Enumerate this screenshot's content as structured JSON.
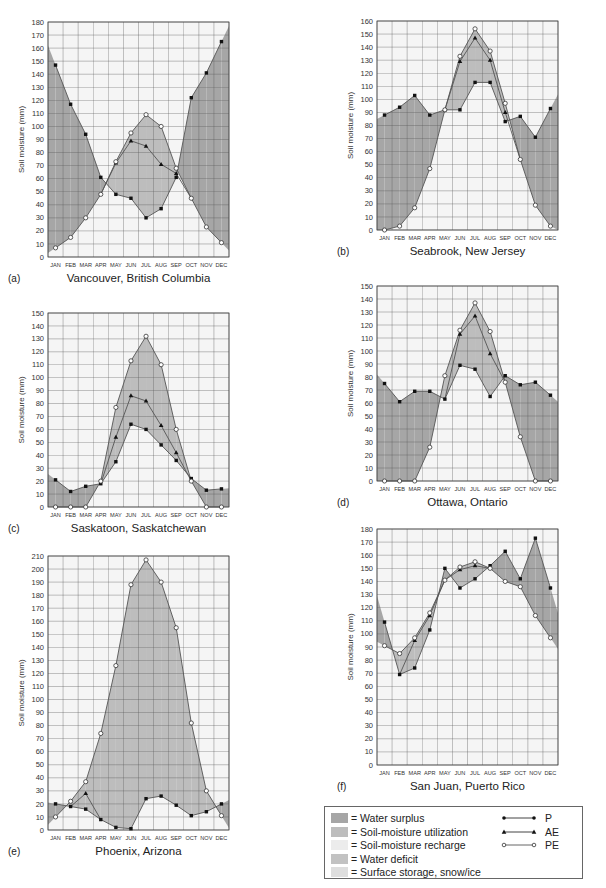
{
  "colors": {
    "surplus": "#a6a6a6",
    "utilization": "#bdbdbd",
    "recharge": "#ececec",
    "deficit": "#c2c2c2",
    "storage": "#dedede",
    "plot_bg": "#f5f5f5",
    "grid": "#5a5a5a",
    "line": "#555555"
  },
  "legend": {
    "areas": [
      {
        "key": "surplus",
        "label": "= Water surplus"
      },
      {
        "key": "utilization",
        "label": "= Soil-moisture utilization"
      },
      {
        "key": "recharge",
        "label": "= Soil-moisture recharge"
      },
      {
        "key": "deficit",
        "label": "= Water deficit"
      },
      {
        "key": "storage",
        "label": "= Surface storage, snow/ice"
      }
    ],
    "lines": [
      {
        "key": "P",
        "label": "P",
        "marker": "filled-circle"
      },
      {
        "key": "AE",
        "label": "AE",
        "marker": "filled-triangle"
      },
      {
        "key": "PE",
        "label": "PE",
        "marker": "open-circle"
      }
    ]
  },
  "chart_data": [
    {
      "id": "a",
      "panel_label": "(a)",
      "type": "line",
      "title": "Vancouver, British Columbia",
      "ylabel": "Soil moisture (mm)",
      "categories": [
        "JAN",
        "FEB",
        "MAR",
        "APR",
        "MAY",
        "JUN",
        "JUL",
        "AUG",
        "SEP",
        "OCT",
        "NOV",
        "DEC"
      ],
      "ylim": [
        0,
        180
      ],
      "ystep": 10,
      "grid": true,
      "series": [
        {
          "name": "P",
          "values": [
            147,
            117,
            94,
            61,
            48,
            45,
            30,
            37,
            61,
            122,
            141,
            165
          ]
        },
        {
          "name": "AE",
          "values": [
            null,
            null,
            null,
            null,
            72,
            89,
            85,
            71,
            64,
            null,
            null,
            null
          ]
        },
        {
          "name": "PE",
          "values": [
            7,
            15,
            30,
            48,
            73,
            95,
            109,
            100,
            68,
            45,
            23,
            11
          ]
        }
      ]
    },
    {
      "id": "b",
      "panel_label": "(b)",
      "type": "line",
      "title": "Seabrook, New Jersey",
      "ylabel": "Soil moisture (mm)",
      "categories": [
        "JAN",
        "FEB",
        "MAR",
        "APR",
        "MAY",
        "JUN",
        "JUL",
        "AUG",
        "SEP",
        "OCT",
        "NOV",
        "DEC"
      ],
      "ylim": [
        0,
        160
      ],
      "ystep": 10,
      "grid": true,
      "series": [
        {
          "name": "P",
          "values": [
            88,
            94,
            103,
            88,
            92,
            92,
            113,
            113,
            83,
            87,
            71,
            93
          ]
        },
        {
          "name": "AE",
          "values": [
            null,
            null,
            null,
            null,
            null,
            129,
            147,
            130,
            90,
            null,
            null,
            null
          ]
        },
        {
          "name": "PE",
          "values": [
            0,
            3,
            17,
            47,
            92,
            133,
            154,
            137,
            97,
            54,
            19,
            3
          ]
        }
      ]
    },
    {
      "id": "c",
      "panel_label": "(c)",
      "type": "line",
      "title": "Saskatoon, Saskatchewan",
      "ylabel": "Soil moisture (mm)",
      "categories": [
        "JAN",
        "FEB",
        "MAR",
        "APR",
        "MAY",
        "JUN",
        "JUL",
        "AUG",
        "SEP",
        "OCT",
        "NOV",
        "DEC"
      ],
      "ylim": [
        0,
        150
      ],
      "ystep": 10,
      "grid": true,
      "series": [
        {
          "name": "P",
          "values": [
            21,
            12,
            16,
            18,
            35,
            64,
            60,
            48,
            36,
            22,
            13,
            14
          ]
        },
        {
          "name": "AE",
          "values": [
            null,
            null,
            null,
            null,
            54,
            86,
            82,
            63,
            42,
            null,
            null,
            null
          ]
        },
        {
          "name": "PE",
          "values": [
            0,
            0,
            0,
            20,
            77,
            113,
            132,
            110,
            60,
            20,
            0,
            0
          ]
        }
      ]
    },
    {
      "id": "d",
      "panel_label": "(d)",
      "type": "line",
      "title": "Ottawa, Ontario",
      "ylabel": "Soil moisture (mm)",
      "categories": [
        "JAN",
        "FEB",
        "MAR",
        "APR",
        "MAY",
        "JUN",
        "JUL",
        "AUG",
        "SEP",
        "OCT",
        "NOV",
        "DEC"
      ],
      "ylim": [
        0,
        150
      ],
      "ystep": 10,
      "grid": true,
      "series": [
        {
          "name": "P",
          "values": [
            75,
            61,
            69,
            69,
            63,
            89,
            86,
            65,
            81,
            74,
            76,
            66
          ]
        },
        {
          "name": "AE",
          "values": [
            null,
            null,
            null,
            null,
            null,
            113,
            127,
            98,
            null,
            null,
            null,
            null
          ]
        },
        {
          "name": "PE",
          "values": [
            0,
            0,
            0,
            26,
            81,
            116,
            137,
            115,
            76,
            34,
            0,
            0
          ]
        }
      ]
    },
    {
      "id": "e",
      "panel_label": "(e)",
      "type": "line",
      "title": "Phoenix, Arizona",
      "ylabel": "Soil moisture (mm)",
      "categories": [
        "JAN",
        "FEB",
        "MAR",
        "APR",
        "MAY",
        "JUN",
        "JUL",
        "AUG",
        "SEP",
        "OCT",
        "NOV",
        "DEC"
      ],
      "ylim": [
        0,
        210
      ],
      "ystep": 10,
      "grid": true,
      "series": [
        {
          "name": "P",
          "values": [
            20,
            18,
            16,
            8,
            2,
            1,
            24,
            26,
            19,
            11,
            14,
            20
          ]
        },
        {
          "name": "AE",
          "values": [
            null,
            null,
            28,
            null,
            null,
            null,
            null,
            null,
            null,
            null,
            null,
            null
          ]
        },
        {
          "name": "PE",
          "values": [
            10,
            22,
            37,
            74,
            126,
            188,
            207,
            190,
            155,
            82,
            30,
            11
          ]
        }
      ]
    },
    {
      "id": "f",
      "panel_label": "(f)",
      "type": "line",
      "title": "San Juan, Puerto Rico",
      "ylabel": "Soil moisture (mm)",
      "categories": [
        "JAN",
        "FEB",
        "MAR",
        "APR",
        "MAY",
        "JUN",
        "JUL",
        "AUG",
        "SEP",
        "OCT",
        "NOV",
        "DEC"
      ],
      "ylim": [
        0,
        180
      ],
      "ystep": 10,
      "grid": true,
      "series": [
        {
          "name": "P",
          "values": [
            109,
            69,
            74,
            103,
            150,
            135,
            142,
            152,
            163,
            142,
            173,
            135
          ]
        },
        {
          "name": "AE",
          "values": [
            null,
            null,
            95,
            114,
            null,
            149,
            152,
            null,
            null,
            null,
            null,
            null
          ]
        },
        {
          "name": "PE",
          "values": [
            91,
            85,
            97,
            116,
            141,
            151,
            155,
            150,
            140,
            136,
            114,
            97
          ]
        }
      ]
    }
  ]
}
